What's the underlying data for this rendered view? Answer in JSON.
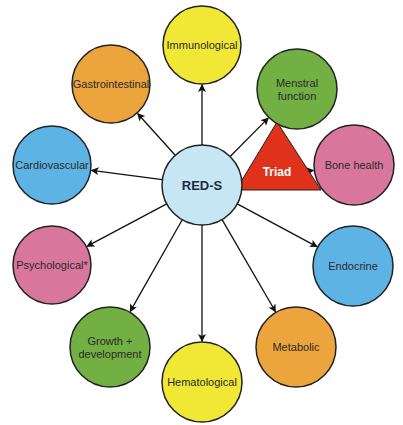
{
  "diagram": {
    "center": {
      "label": "RED-S",
      "x": 202,
      "y": 185,
      "r": 40,
      "color": "#c6e6f3"
    },
    "triad": {
      "label": "Triad",
      "color": "#e0321a",
      "points": "236,190 277,122 321,190"
    },
    "nodes": [
      {
        "id": "immunological",
        "label": "Immunological",
        "lines": [
          "Immunological"
        ],
        "x": 202,
        "y": 45,
        "r": 39,
        "color": "#f1e835"
      },
      {
        "id": "gastrointestinal",
        "label": "Gastrointestinal",
        "lines": [
          "Gastrointestinal"
        ],
        "x": 111,
        "y": 84,
        "r": 39,
        "color": "#eca43c"
      },
      {
        "id": "menstral-function",
        "label": "Menstral function",
        "lines": [
          "Menstral",
          "function"
        ],
        "x": 297,
        "y": 89,
        "r": 40,
        "color": "#72b044"
      },
      {
        "id": "cardiovascular",
        "label": "Cardiovascular",
        "lines": [
          "Cardiovascular"
        ],
        "x": 52,
        "y": 165,
        "r": 39,
        "color": "#5db4e4"
      },
      {
        "id": "bone-health",
        "label": "Bone health",
        "lines": [
          "Bone health"
        ],
        "x": 354,
        "y": 165,
        "r": 40,
        "color": "#d8779b"
      },
      {
        "id": "psychological",
        "label": "Psychological*",
        "lines": [
          "Psychological*"
        ],
        "x": 52,
        "y": 265,
        "r": 39,
        "color": "#d8779b"
      },
      {
        "id": "endocrine",
        "label": "Endocrine",
        "lines": [
          "Endocrine"
        ],
        "x": 353,
        "y": 266,
        "r": 40,
        "color": "#5db4e4"
      },
      {
        "id": "growth-development",
        "label": "Growth + development",
        "lines": [
          "Growth +",
          "development"
        ],
        "x": 110,
        "y": 347,
        "r": 40,
        "color": "#72b044"
      },
      {
        "id": "metabolic",
        "label": "Metabolic",
        "lines": [
          "Metabolic"
        ],
        "x": 296,
        "y": 347,
        "r": 40,
        "color": "#eca43c"
      },
      {
        "id": "hematological",
        "label": "Hematological",
        "lines": [
          "Hematological"
        ],
        "x": 202,
        "y": 382,
        "r": 40,
        "color": "#f1e835"
      }
    ],
    "edges_from_center_to": [
      "immunological",
      "gastrointestinal",
      "menstral-function",
      "cardiovascular",
      "bone-health",
      "psychological",
      "endocrine",
      "growth-development",
      "metabolic",
      "hematological"
    ]
  }
}
